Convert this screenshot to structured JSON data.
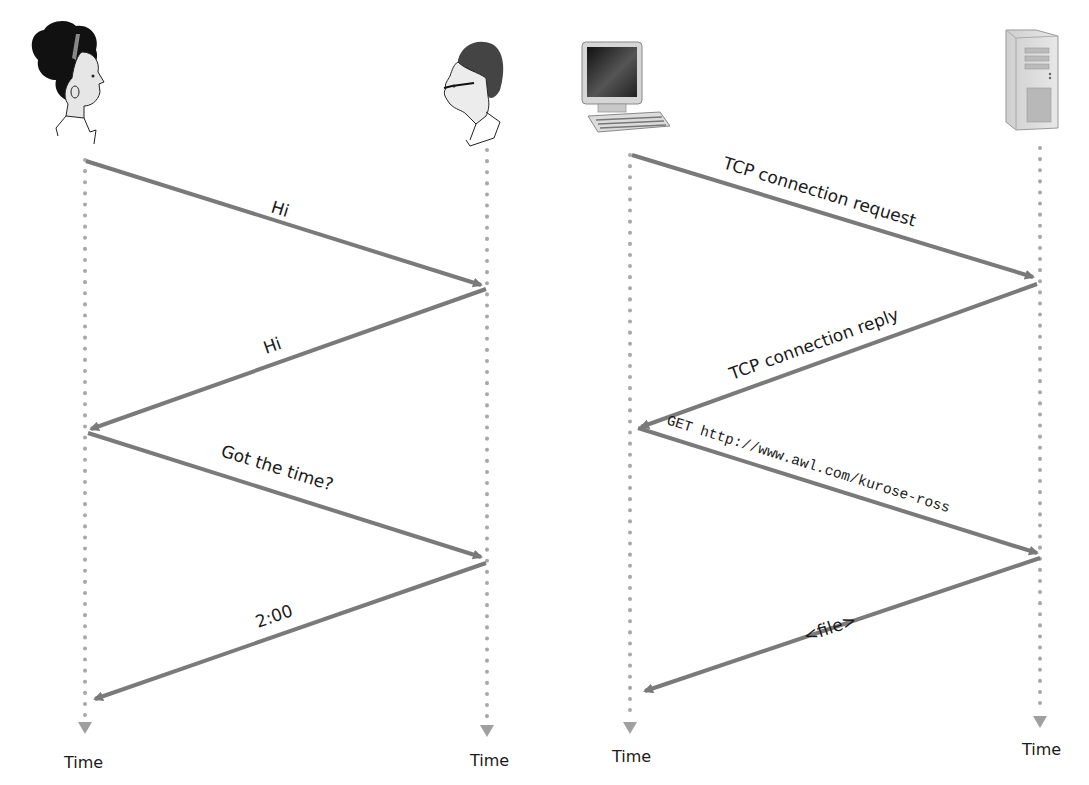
{
  "figure": {
    "left_panel": {
      "title": "Human protocol",
      "actors": [
        {
          "name": "Person A (woman)",
          "icon": "person-woman-icon",
          "x": 85
        },
        {
          "name": "Person B (man)",
          "icon": "person-man-icon",
          "x": 487
        }
      ],
      "messages": [
        {
          "label": "Hi",
          "from": "Person A",
          "to": "Person B"
        },
        {
          "label": "Hi",
          "from": "Person B",
          "to": "Person A"
        },
        {
          "label": "Got the time?",
          "from": "Person A",
          "to": "Person B"
        },
        {
          "label": "2:00",
          "from": "Person B",
          "to": "Person A"
        }
      ],
      "time_labels": [
        "Time",
        "Time"
      ]
    },
    "right_panel": {
      "title": "Computer network protocol",
      "actors": [
        {
          "name": "Client computer",
          "icon": "desktop-computer-icon",
          "x": 630
        },
        {
          "name": "Server",
          "icon": "server-tower-icon",
          "x": 1040
        }
      ],
      "messages": [
        {
          "label": "TCP connection request",
          "from": "Client",
          "to": "Server"
        },
        {
          "label": "TCP connection reply",
          "from": "Server",
          "to": "Client"
        },
        {
          "label": "GET http://www.awl.com/kurose-ross",
          "from": "Client",
          "to": "Server"
        },
        {
          "label": "<file>",
          "from": "Server",
          "to": "Client"
        }
      ],
      "time_labels": [
        "Time",
        "Time"
      ]
    },
    "colors": {
      "arrow": "#7a7a7a",
      "lifeline_dots": "#a8a8a8",
      "time_arrowhead": "#a0a0a0",
      "text": "#1a1a1a"
    }
  }
}
